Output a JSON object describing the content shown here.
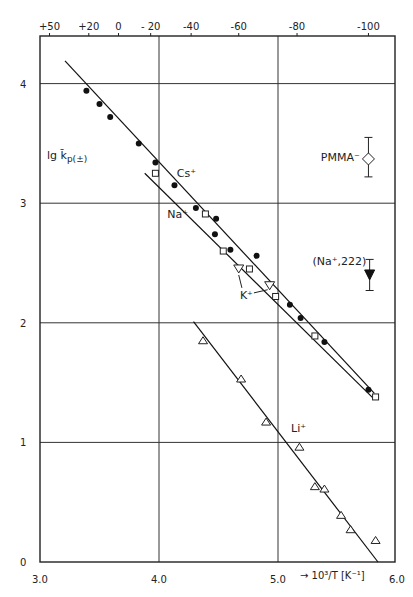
{
  "chart_data": {
    "type": "scatter",
    "title": "",
    "xlabel": "→ 10³/T [K⁻¹]",
    "ylabel": "lg k̄p(±)",
    "xlim": [
      3.0,
      6.0
    ],
    "ylim": [
      0,
      4.4
    ],
    "grid": true,
    "x_ticks": [
      3.0,
      4.0,
      5.0,
      6.0
    ],
    "x_tick_labels": [
      "3.0",
      "4.0",
      "5.0",
      "6.0"
    ],
    "y_ticks": [
      0,
      1,
      2,
      3,
      4
    ],
    "y_tick_labels": [
      "0",
      "1",
      "2",
      "3",
      "4"
    ],
    "top_axis": {
      "label": "Temperature (°C)",
      "ticks": [
        {
          "label": "+50",
          "x": 3.08
        },
        {
          "label": "+20",
          "x": 3.41
        },
        {
          "label": "0",
          "x": 3.66
        },
        {
          "label": "- 20",
          "x": 3.93
        },
        {
          "label": "-40",
          "x": 4.27
        },
        {
          "label": "-60",
          "x": 4.67
        },
        {
          "label": "-80",
          "x": 5.16
        },
        {
          "label": "-100",
          "x": 5.76
        }
      ]
    },
    "series": [
      {
        "name": "Cs+",
        "label": "Cs⁺",
        "marker": "filled-circle",
        "points": [
          [
            3.39,
            3.94
          ],
          [
            3.5,
            3.83
          ],
          [
            3.59,
            3.72
          ],
          [
            3.83,
            3.5
          ],
          [
            3.97,
            3.34
          ],
          [
            4.13,
            3.15
          ],
          [
            4.31,
            2.96
          ],
          [
            4.48,
            2.87
          ],
          [
            4.47,
            2.74
          ],
          [
            4.6,
            2.61
          ],
          [
            4.82,
            2.56
          ],
          [
            5.1,
            2.15
          ],
          [
            5.19,
            2.04
          ],
          [
            5.39,
            1.84
          ],
          [
            5.76,
            1.44
          ]
        ],
        "fit_line": [
          [
            3.21,
            4.19
          ],
          [
            5.81,
            1.41
          ]
        ],
        "label_pos": [
          4.15,
          3.22
        ]
      },
      {
        "name": "Na+",
        "label": "Na⁺",
        "marker": "open-square",
        "points": [
          [
            3.97,
            3.25
          ],
          [
            4.39,
            2.91
          ],
          [
            4.54,
            2.6
          ],
          [
            4.76,
            2.45
          ],
          [
            4.98,
            2.22
          ],
          [
            5.31,
            1.89
          ],
          [
            5.82,
            1.38
          ]
        ],
        "fit_line": [
          [
            3.88,
            3.25
          ],
          [
            5.81,
            1.36
          ]
        ],
        "label_pos": [
          4.07,
          2.88
        ]
      },
      {
        "name": "K+",
        "label": "K⁺",
        "marker": "open-triangle-down",
        "points": [
          [
            4.67,
            2.45
          ],
          [
            4.93,
            2.31
          ]
        ],
        "label_pos": [
          4.68,
          2.2
        ]
      },
      {
        "name": "Li+",
        "label": "Li⁺",
        "marker": "open-triangle-up",
        "points": [
          [
            4.37,
            1.85
          ],
          [
            4.69,
            1.53
          ],
          [
            4.9,
            1.17
          ],
          [
            5.18,
            0.96
          ],
          [
            5.31,
            0.63
          ],
          [
            5.39,
            0.61
          ],
          [
            5.53,
            0.39
          ],
          [
            5.61,
            0.27
          ],
          [
            5.82,
            0.18
          ]
        ],
        "fit_line": [
          [
            4.29,
            2.01
          ],
          [
            5.84,
            0.0
          ]
        ],
        "label_pos": [
          5.11,
          1.09
        ]
      },
      {
        "name": "PMMA-",
        "label": "PMMA⁻",
        "marker": "open-diamond",
        "points": [
          [
            5.76,
            3.37
          ]
        ],
        "error": [
          3.22,
          3.55
        ],
        "label_pos": [
          5.36,
          3.35
        ]
      },
      {
        "name": "(Na+,222)",
        "label": "(Na⁺,222)",
        "marker": "filled-triangle-down",
        "points": [
          [
            5.77,
            2.4
          ]
        ],
        "error": [
          2.27,
          2.53
        ],
        "label_pos": [
          5.29,
          2.48
        ]
      }
    ]
  },
  "axes": {
    "y_title_main": "lg k̄",
    "y_title_sub": "p(±)",
    "x_title": "→ 10³/T [K⁻¹]"
  }
}
